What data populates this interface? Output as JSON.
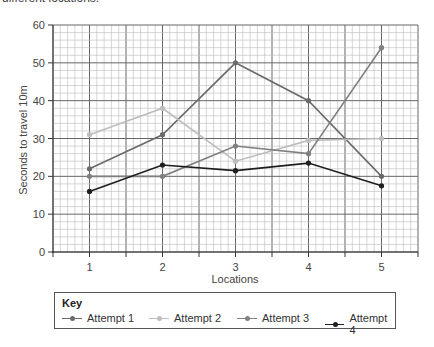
{
  "caption_clipped": "different locations.",
  "chart_data": {
    "type": "line",
    "title": "",
    "xlabel": "Locations",
    "ylabel": "Seconds to travel 10m",
    "x": [
      1,
      2,
      3,
      4,
      5
    ],
    "x_tick_labels": [
      "1",
      "2",
      "3",
      "4",
      "5"
    ],
    "y_tick_labels": [
      "0",
      "10",
      "20",
      "30",
      "40",
      "50",
      "60"
    ],
    "ylim": [
      0,
      60
    ],
    "xlim": [
      0.5,
      5.5
    ],
    "grid": true,
    "legend_title": "Key",
    "legend_position": "bottom",
    "series": [
      {
        "name": "Attempt 1",
        "values": [
          22,
          31,
          50,
          40,
          20
        ],
        "color": "#6a6a6a"
      },
      {
        "name": "Attempt 2",
        "values": [
          31,
          38,
          24,
          29.5,
          30
        ],
        "color": "#bdbdbd"
      },
      {
        "name": "Attempt 3",
        "values": [
          20,
          20,
          28,
          26,
          54
        ],
        "color": "#808080"
      },
      {
        "name": "Attempt 4",
        "values": [
          16,
          23,
          21.5,
          23.5,
          17.5
        ],
        "color": "#1e1e1e"
      }
    ]
  },
  "key": {
    "title": "Key",
    "items": [
      {
        "label": "Attempt 1"
      },
      {
        "label": "Attempt 2"
      },
      {
        "label": "Attempt 3"
      },
      {
        "label": "Attempt 4"
      }
    ]
  }
}
